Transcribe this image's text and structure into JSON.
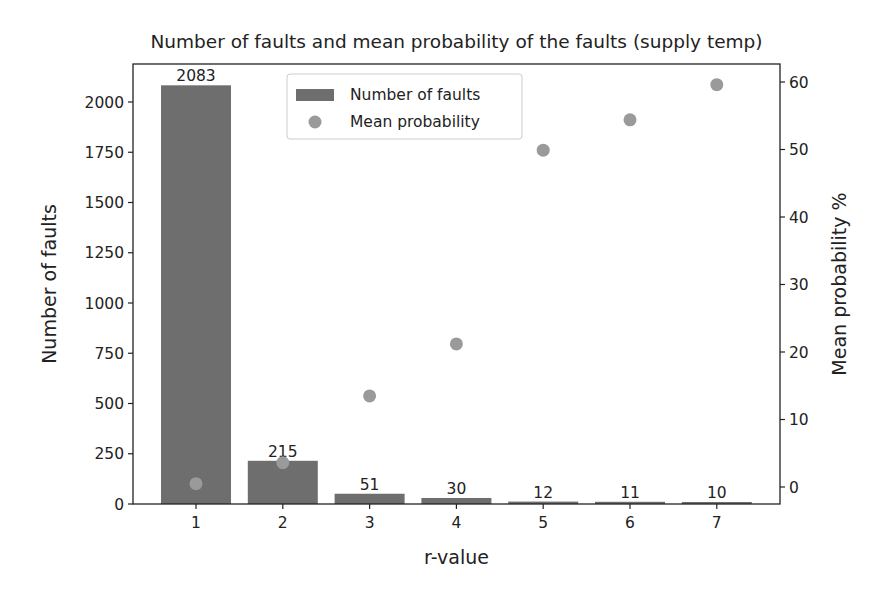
{
  "chart_data": {
    "type": "bar",
    "title": "Number of faults and mean probability of the faults (supply temp)",
    "xlabel": "r-value",
    "ylabel": "Number of faults",
    "ylabel_right": "Mean probability %",
    "categories": [
      "1",
      "2",
      "3",
      "4",
      "5",
      "6",
      "7"
    ],
    "series": [
      {
        "name": "Number of faults",
        "type": "bar",
        "axis": "left",
        "color": "#6e6e6e",
        "values": [
          2083,
          215,
          51,
          30,
          12,
          11,
          10
        ],
        "data_labels": [
          "2083",
          "215",
          "51",
          "30",
          "12",
          "11",
          "10"
        ]
      },
      {
        "name": "Mean probability",
        "type": "scatter",
        "axis": "right",
        "color": "#9a9a9a",
        "values": [
          0.5,
          3.6,
          13.5,
          21.2,
          49.9,
          54.4,
          59.6
        ]
      }
    ],
    "ylim": [
      0,
      2185
    ],
    "ylim_right": [
      -2.5,
      62.5
    ],
    "yticks": [
      "0",
      "250",
      "500",
      "750",
      "1000",
      "1250",
      "1500",
      "1750",
      "2000"
    ],
    "yticks_right": [
      "0",
      "10",
      "20",
      "30",
      "40",
      "50",
      "60"
    ],
    "grid": false,
    "legend": {
      "position": "upper center",
      "entries": [
        "Number of faults",
        "Mean probability"
      ]
    }
  }
}
